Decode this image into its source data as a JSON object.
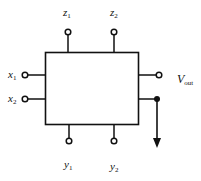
{
  "diagram": {
    "type": "block-terminal-diagram",
    "colors": {
      "stroke": "#111111",
      "background": "#ffffff"
    },
    "block": {
      "label": ""
    },
    "terminals": {
      "top": [
        {
          "id": "z1",
          "var": "z",
          "sub": "1",
          "kind": "open"
        },
        {
          "id": "z2",
          "var": "z",
          "sub": "2",
          "kind": "open"
        }
      ],
      "left": [
        {
          "id": "x1",
          "var": "x",
          "sub": "1",
          "kind": "open"
        },
        {
          "id": "x2",
          "var": "x",
          "sub": "2",
          "kind": "open"
        }
      ],
      "right": [
        {
          "id": "vout",
          "var": "V",
          "sub": "out",
          "kind": "open"
        },
        {
          "id": "out2",
          "var": "",
          "sub": "",
          "kind": "filled",
          "arrow": "down"
        }
      ],
      "bottom": [
        {
          "id": "y1",
          "var": "y",
          "sub": "1",
          "kind": "open"
        },
        {
          "id": "y2",
          "var": "y",
          "sub": "2",
          "kind": "open"
        }
      ]
    }
  }
}
